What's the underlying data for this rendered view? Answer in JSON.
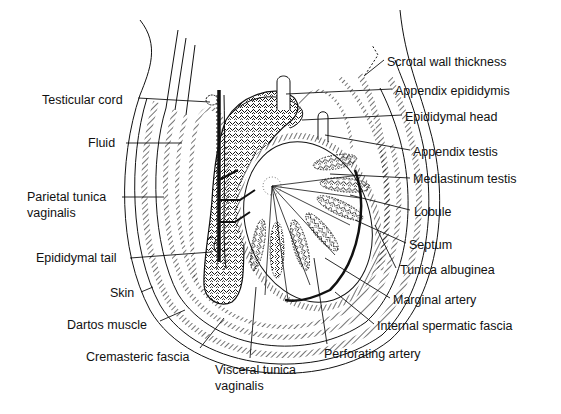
{
  "figure": {
    "labels_left": [
      {
        "id": "testicular-cord",
        "text": "Testicular cord",
        "x": 42,
        "y": 93
      },
      {
        "id": "fluid",
        "text": "Fluid",
        "x": 88,
        "y": 136
      },
      {
        "id": "parietal-tunica-vaginalis-1",
        "text": "Parietal tunica",
        "x": 27,
        "y": 192
      },
      {
        "id": "parietal-tunica-vaginalis-2",
        "text": "vaginalis",
        "x": 27,
        "y": 208
      },
      {
        "id": "epididymal-tail",
        "text": "Epididymal tail",
        "x": 36,
        "y": 252
      },
      {
        "id": "skin",
        "text": "Skin",
        "x": 110,
        "y": 287
      },
      {
        "id": "dartos-muscle",
        "text": "Dartos muscle",
        "x": 67,
        "y": 319
      },
      {
        "id": "cremasteric-fascia",
        "text": "Cremasteric fascia",
        "x": 86,
        "y": 351
      }
    ],
    "labels_bottom": [
      {
        "id": "visceral-tunica-vaginalis-1",
        "text": "Visceral tunica",
        "x": 215,
        "y": 364
      },
      {
        "id": "visceral-tunica-vaginalis-2",
        "text": "vaginalis",
        "x": 215,
        "y": 380
      },
      {
        "id": "perforating-artery",
        "text": "Perforating artery",
        "x": 324,
        "y": 348
      }
    ],
    "labels_right": [
      {
        "id": "scrotal-wall-thickness",
        "text": "Scrotal wall thickness",
        "x": 387,
        "y": 56
      },
      {
        "id": "appendix-epididymis",
        "text": "Appendix epididymis",
        "x": 395,
        "y": 85
      },
      {
        "id": "epididymal-head",
        "text": "Epididymal head",
        "x": 405,
        "y": 111
      },
      {
        "id": "appendix-testis",
        "text": "Appendix testis",
        "x": 413,
        "y": 146
      },
      {
        "id": "mediastinum-testis",
        "text": "Mediastinum testis",
        "x": 413,
        "y": 173
      },
      {
        "id": "lobule",
        "text": "Lobule",
        "x": 414,
        "y": 206
      },
      {
        "id": "septum",
        "text": "Septum",
        "x": 409,
        "y": 239
      },
      {
        "id": "tunica-albuginea",
        "text": "Tunica albuginea",
        "x": 400,
        "y": 264
      },
      {
        "id": "marginal-artery",
        "text": "Marginal artery",
        "x": 393,
        "y": 294
      },
      {
        "id": "internal-spermatic-fascia",
        "text": "Internal spermatic fascia",
        "x": 377,
        "y": 320
      }
    ]
  }
}
